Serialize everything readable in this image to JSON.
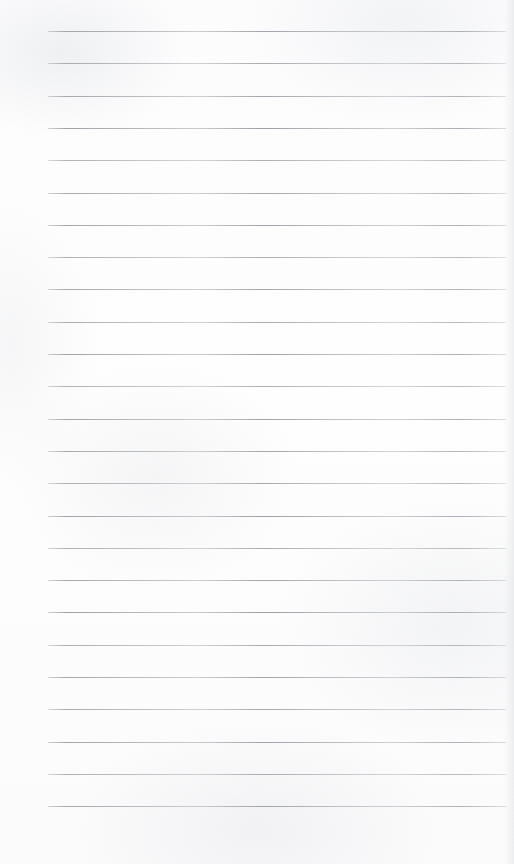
{
  "document": {
    "kind": "lined-paper",
    "title": "Blank lined page",
    "page_width": 514,
    "page_height": 864,
    "background_color": "#fdfdfd",
    "text_content": "",
    "has_text": false,
    "has_margin_rule": false,
    "header": "",
    "footer": "",
    "page_number": ""
  },
  "ruling": {
    "line_color": "#a8aab0",
    "line_thickness_px": 1,
    "line_count": 25,
    "first_line_y": 31,
    "line_spacing_px": 32.3,
    "line_start_x": 48,
    "line_end_x": 506,
    "left_margin_px": 48,
    "right_margin_px": 8,
    "lines_y": [
      31,
      63.3,
      95.6,
      127.9,
      160.2,
      192.5,
      224.8,
      257.1,
      289.4,
      321.7,
      354.0,
      386.3,
      418.6,
      450.9,
      483.2,
      515.5,
      547.8,
      580.1,
      612.4,
      644.7,
      677.0,
      709.3,
      741.6,
      773.9,
      806.2
    ],
    "line_opacities": [
      0.9,
      0.82,
      0.88,
      0.95,
      0.78,
      0.86,
      0.92,
      0.8,
      0.88,
      0.84,
      0.94,
      0.79,
      0.9,
      0.86,
      0.82,
      0.93,
      0.81,
      0.88,
      0.95,
      0.83,
      0.9,
      0.85,
      0.92,
      0.8,
      0.88
    ]
  }
}
